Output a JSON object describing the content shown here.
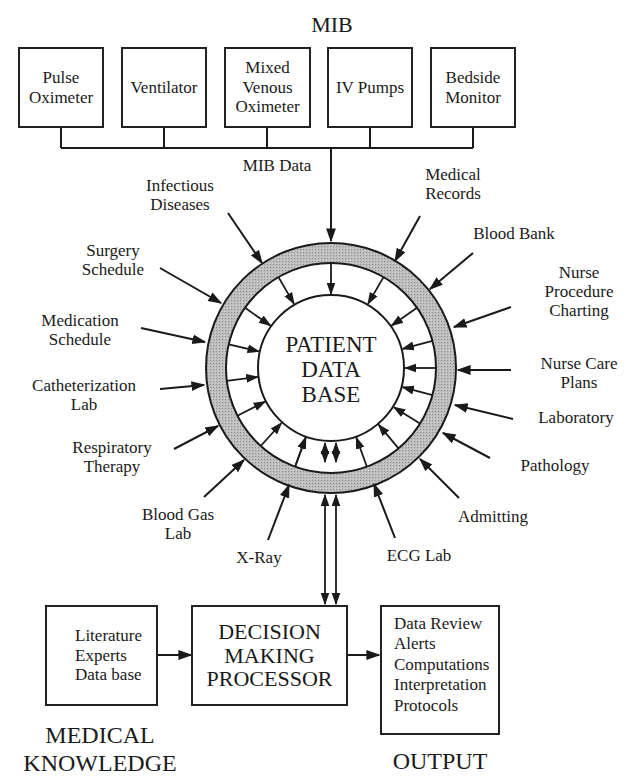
{
  "mib": {
    "title": "MIB",
    "devices": [
      {
        "label": "Pulse\nOximeter"
      },
      {
        "label": "Ventilator"
      },
      {
        "label": "Mixed\nVenous\nOximeter"
      },
      {
        "label": "IV Pumps"
      },
      {
        "label": "Bedside\nMonitor"
      }
    ],
    "data_label": "MIB Data"
  },
  "center": {
    "line1": "PATIENT",
    "line2": "DATA",
    "line3": "BASE"
  },
  "sources_left": [
    {
      "label": "Infectious\nDiseases"
    },
    {
      "label": "Surgery\nSchedule"
    },
    {
      "label": "Medication\nSchedule"
    },
    {
      "label": "Catheterization\nLab"
    },
    {
      "label": "Respiratory\nTherapy"
    },
    {
      "label": "Blood Gas\nLab"
    },
    {
      "label": "X-Ray"
    }
  ],
  "sources_right": [
    {
      "label": "Medical\nRecords"
    },
    {
      "label": "Blood Bank"
    },
    {
      "label": "Nurse\nProcedure\nCharting"
    },
    {
      "label": "Nurse Care\nPlans"
    },
    {
      "label": "Laboratory"
    },
    {
      "label": "Pathology"
    },
    {
      "label": "Admitting"
    },
    {
      "label": "ECG Lab"
    }
  ],
  "knowledge": {
    "items": [
      "Literature",
      "Experts",
      "Data base"
    ],
    "caption_line1": "MEDICAL",
    "caption_line2": "KNOWLEDGE"
  },
  "processor": {
    "line1": "DECISION",
    "line2": "MAKING",
    "line3": "PROCESSOR"
  },
  "output": {
    "items": [
      "Data Review",
      "Alerts",
      "Computations",
      "Interpretation",
      "Protocols"
    ],
    "caption": "OUTPUT"
  },
  "colors": {
    "ink": "#1a1a1a",
    "ring_fill": "#b5b5b5",
    "background": "#ffffff"
  }
}
